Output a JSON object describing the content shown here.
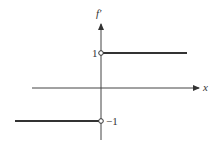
{
  "diagram": {
    "y_axis_label": "f′",
    "x_axis_label": "x",
    "tick_upper": "1",
    "tick_lower": "−1",
    "segments": [
      {
        "name": "upper",
        "y_value": 1,
        "x_range": "x > 0",
        "endpoint": "open circle at x=0"
      },
      {
        "name": "lower",
        "y_value": -1,
        "x_range": "x < 0",
        "endpoint": "open circle at x=0"
      }
    ],
    "colors": {
      "line": "#333333",
      "background": "#ffffff"
    }
  }
}
